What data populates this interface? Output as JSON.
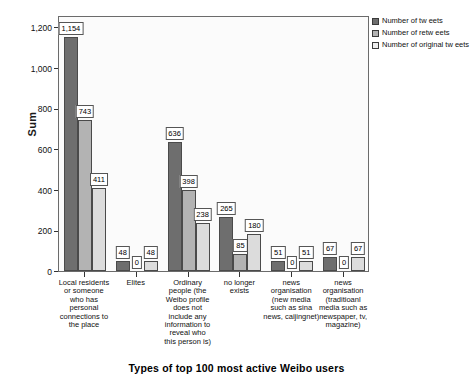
{
  "chart_data": {
    "type": "bar",
    "title": "Types of top 100 most active Weibo users",
    "xlabel": "",
    "ylabel": "Sum",
    "ylim": [
      0,
      1260
    ],
    "yticks": [
      0,
      200,
      400,
      600,
      800,
      1000,
      1200
    ],
    "ytick_labels": [
      "0",
      "200",
      "400",
      "600",
      "800",
      "1,000",
      "1,200"
    ],
    "grid": false,
    "legend_position": "top-right",
    "categories": [
      "Local residents or someone who has personal connections to the place",
      "Elites",
      "Ordinary people (the Weibo profile does not include any information to reveal who this person is)",
      "no longer exists",
      "news organisation (new media such as sina news, caijingnet)",
      "news organisation (traditioanl media such as newspaper, tv, magazine)"
    ],
    "series": [
      {
        "name": "Number of tweets",
        "values": [
          1154,
          48,
          636,
          265,
          51,
          67
        ]
      },
      {
        "name": "Number of retweets",
        "values": [
          743,
          0,
          398,
          85,
          0,
          0
        ]
      },
      {
        "name": "Number of original tweets",
        "values": [
          411,
          48,
          238,
          180,
          51,
          67
        ]
      }
    ],
    "data_labels": [
      [
        "1,154",
        "743",
        "411"
      ],
      [
        "48",
        "0",
        "48"
      ],
      [
        "636",
        "398",
        "238"
      ],
      [
        "265",
        "85",
        "180"
      ],
      [
        "51",
        "0",
        "51"
      ],
      [
        "67",
        "0",
        "67"
      ]
    ],
    "colors": {
      "series_0": "#6e6e6e",
      "series_1": "#b3b3b3",
      "series_2": "#dcdcdc",
      "frame": "#6b6b6b",
      "plot_background": "#fbfbfb",
      "text": "#111111"
    }
  },
  "legend": {
    "items": [
      {
        "label": "Number of tw eets"
      },
      {
        "label": "Number of retw eets"
      },
      {
        "label": "Number of original tw eets"
      }
    ]
  },
  "axis": {
    "y_title": "Sum"
  }
}
